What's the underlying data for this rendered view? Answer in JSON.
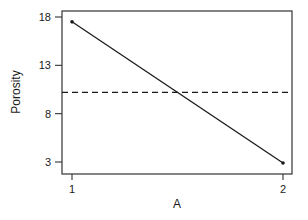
{
  "chart_data": {
    "type": "line",
    "title": "",
    "xlabel": "A",
    "ylabel": "Porosity",
    "categories": [
      "1",
      "2"
    ],
    "series": [
      {
        "name": "Porosity mean",
        "values": [
          17.5,
          2.9
        ]
      }
    ],
    "reference_line": {
      "style": "dashed",
      "value": 10.2,
      "label": ""
    },
    "yticks": [
      3,
      8,
      13,
      18
    ],
    "ytick_labels": [
      "3",
      "8",
      "13",
      "18"
    ],
    "xticks": [
      "1",
      "2"
    ],
    "ylim": [
      1.5,
      18.6
    ],
    "grid": false,
    "legend": "none"
  },
  "colors": {
    "line": "#1a1a1a",
    "axis": "#333333",
    "background": "#ffffff"
  }
}
